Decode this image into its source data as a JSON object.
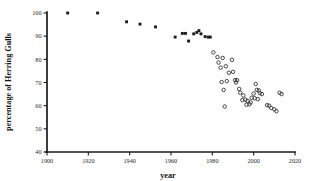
{
  "chart_data": {
    "type": "scatter",
    "title": "",
    "xlabel": "year",
    "ylabel": "percentage of Herring Gulls",
    "xlim": [
      1900,
      2020
    ],
    "ylim": [
      40,
      100
    ],
    "xticks": [
      1900,
      1920,
      1940,
      1960,
      1980,
      2000,
      2020
    ],
    "xtick_labels": [
      "1900",
      "1920",
      "1940",
      "1960",
      "1980",
      "2000",
      "2020"
    ],
    "yticks": [
      40,
      50,
      60,
      70,
      80,
      90,
      100
    ],
    "ytick_labels": [
      "40",
      "50",
      "60",
      "70",
      "80",
      "90",
      "100"
    ],
    "grid": false,
    "legend": "none",
    "series": [
      {
        "name": "historical-filled-squares",
        "marker": "filled-square",
        "color": "#1c1c1c",
        "points": [
          [
            1910.0,
            100.0
          ],
          [
            1924.5,
            100.0
          ],
          [
            1938.5,
            96.2
          ],
          [
            1945.0,
            95.2
          ],
          [
            1952.5,
            94.0
          ],
          [
            1962.0,
            89.6
          ],
          [
            1965.5,
            91.2
          ],
          [
            1967.0,
            91.2
          ],
          [
            1971.0,
            91.0
          ],
          [
            1972.5,
            91.6
          ],
          [
            1973.5,
            92.4
          ],
          [
            1974.5,
            91.0
          ],
          [
            1968.5,
            87.9
          ],
          [
            1976.5,
            89.8
          ],
          [
            1978.0,
            89.6
          ],
          [
            1979.0,
            89.6
          ]
        ]
      },
      {
        "name": "recent-open-circles",
        "marker": "open-circle",
        "color": "#2a2a2a",
        "points": [
          [
            1980.5,
            83.0
          ],
          [
            1982.5,
            81.0
          ],
          [
            1983.0,
            78.6
          ],
          [
            1985.0,
            80.6
          ],
          [
            1989.5,
            79.8
          ],
          [
            1984.0,
            76.4
          ],
          [
            1986.5,
            77.0
          ],
          [
            1988.0,
            74.2
          ],
          [
            1990.0,
            74.6
          ],
          [
            1984.5,
            70.2
          ],
          [
            1987.0,
            70.6
          ],
          [
            1991.0,
            71.0
          ],
          [
            1992.0,
            71.0
          ],
          [
            1991.5,
            70.0
          ],
          [
            1985.5,
            66.8
          ],
          [
            1993.5,
            65.6
          ],
          [
            1995.0,
            64.4
          ],
          [
            1994.5,
            62.4
          ],
          [
            1996.0,
            62.6
          ],
          [
            1997.0,
            62.0
          ],
          [
            1996.5,
            60.4
          ],
          [
            1998.0,
            60.6
          ],
          [
            1999.0,
            63.4
          ],
          [
            2000.0,
            65.2
          ],
          [
            2001.0,
            69.4
          ],
          [
            2001.5,
            66.8
          ],
          [
            2002.5,
            66.6
          ],
          [
            2003.0,
            65.4
          ],
          [
            2004.0,
            65.0
          ],
          [
            2000.5,
            63.2
          ],
          [
            2002.0,
            62.8
          ],
          [
            2006.5,
            60.2
          ],
          [
            2007.5,
            60.0
          ],
          [
            2008.5,
            59.0
          ],
          [
            2010.0,
            58.4
          ],
          [
            2011.0,
            57.6
          ],
          [
            2012.5,
            65.6
          ],
          [
            2013.5,
            65.0
          ],
          [
            1986.0,
            59.6
          ],
          [
            1993.0,
            67.2
          ],
          [
            1998.5,
            61.4
          ]
        ]
      }
    ]
  }
}
